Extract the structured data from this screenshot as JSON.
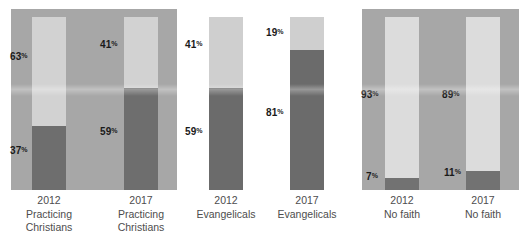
{
  "chart_data": {
    "type": "bar",
    "title": "",
    "subtitle": "",
    "xlabel": "",
    "ylabel": "",
    "ylim": [
      0,
      100
    ],
    "grid": false,
    "legend": "none",
    "stacked": true,
    "unit": "%",
    "categories": [
      "2012 Practicing Christians",
      "2017 Practicing Christians",
      "2012 Evangelicals",
      "2017 Evangelicals",
      "2012 No faith",
      "2017 No faith"
    ],
    "series": [
      {
        "name": "lower-segment",
        "values": [
          37,
          59,
          59,
          81,
          7,
          11
        ]
      },
      {
        "name": "upper-segment",
        "values": [
          63,
          41,
          41,
          19,
          93,
          89
        ]
      }
    ],
    "colors": {
      "dark_segment": "#6e6e6e",
      "light_segment": "#d2d2d2",
      "panel_background": "#a7a7a7",
      "page_background": "#ffffff",
      "label_text": "#1a1a1a",
      "caption_text": "#4d4d4d"
    }
  },
  "groups": [
    {
      "id": "practicing-christians",
      "background": "panel",
      "columns": [
        {
          "id": "pc-2012",
          "year": "2012",
          "caption_line1": "2012",
          "caption_line2": "Practicing",
          "caption_line3": "Christians",
          "upper": {
            "value": 63,
            "label": "63",
            "unit": "%"
          },
          "lower": {
            "value": 37,
            "label": "37",
            "unit": "%"
          }
        },
        {
          "id": "pc-2017",
          "year": "2017",
          "caption_line1": "2017",
          "caption_line2": "Practicing",
          "caption_line3": "Christians",
          "upper": {
            "value": 41,
            "label": "41",
            "unit": "%"
          },
          "lower": {
            "value": 59,
            "label": "59",
            "unit": "%"
          }
        }
      ]
    },
    {
      "id": "evangelicals",
      "background": "white",
      "columns": [
        {
          "id": "ev-2012",
          "year": "2012",
          "caption_line1": "2012",
          "caption_line2": "Evangelicals",
          "caption_line3": "",
          "upper": {
            "value": 41,
            "label": "41",
            "unit": "%"
          },
          "lower": {
            "value": 59,
            "label": "59",
            "unit": "%"
          }
        },
        {
          "id": "ev-2017",
          "year": "2017",
          "caption_line1": "2017",
          "caption_line2": "Evangelicals",
          "caption_line3": "",
          "upper": {
            "value": 19,
            "label": "19",
            "unit": "%"
          },
          "lower": {
            "value": 81,
            "label": "81",
            "unit": "%"
          }
        }
      ]
    },
    {
      "id": "no-faith",
      "background": "panel",
      "columns": [
        {
          "id": "nf-2012",
          "year": "2012",
          "caption_line1": "2012",
          "caption_line2": "No faith",
          "caption_line3": "",
          "upper": {
            "value": 93,
            "label": "93",
            "unit": "%"
          },
          "lower": {
            "value": 7,
            "label": "7",
            "unit": "%"
          }
        },
        {
          "id": "nf-2017",
          "year": "2017",
          "caption_line1": "2017",
          "caption_line2": "No faith",
          "caption_line3": "",
          "upper": {
            "value": 89,
            "label": "89",
            "unit": "%"
          },
          "lower": {
            "value": 11,
            "label": "11",
            "unit": "%"
          }
        }
      ]
    }
  ]
}
